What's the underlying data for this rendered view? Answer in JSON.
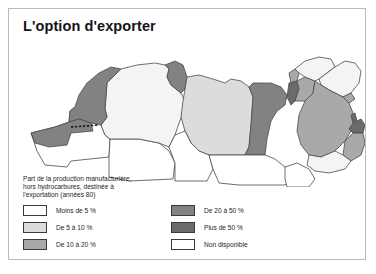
{
  "figure": {
    "title": "L'option d'exporter"
  },
  "legend": {
    "caption": "Part de la production manufacturière,\nhors hydrocarbures, destinée à\nl'exportation (années 80)",
    "columns": [
      {
        "items": [
          {
            "label": "Moins de 5 %",
            "color": "#ffffff"
          },
          {
            "label": "De 5 à 10 %",
            "color": "#dcdcdc"
          },
          {
            "label": "De 10 à 20 %",
            "color": "#a9a9a9"
          }
        ]
      },
      {
        "items": [
          {
            "label": "De 20 à 50 %",
            "color": "#828282"
          },
          {
            "label": "Plus de 50 %",
            "color": "#6b6b6b"
          },
          {
            "label": "Non disponible",
            "color": "#ffffff"
          }
        ]
      }
    ]
  },
  "map": {
    "description": "Carte de l'Afrique du Nord et du Moyen-Orient",
    "stroke": "#4a4a4a",
    "regions": [
      {
        "name": "maroc",
        "class": "De 20 à 50 %",
        "color": "#828282"
      },
      {
        "name": "sahara-occidental",
        "class": "De 20 à 50 %",
        "color": "#828282"
      },
      {
        "name": "mauritanie",
        "class": "Non disponible",
        "color": "#ffffff"
      },
      {
        "name": "algerie",
        "class": "Moins de 5 %",
        "color": "#f4f4f4"
      },
      {
        "name": "tunisie",
        "class": "De 20 à 50 %",
        "color": "#828282"
      },
      {
        "name": "libye",
        "class": "De 5 à 10 %",
        "color": "#dcdcdc"
      },
      {
        "name": "egypte",
        "class": "De 20 à 50 %",
        "color": "#828282"
      },
      {
        "name": "mali-niger",
        "class": "Non disponible",
        "color": "#ffffff"
      },
      {
        "name": "tchad",
        "class": "Non disponible",
        "color": "#ffffff"
      },
      {
        "name": "soudan",
        "class": "Non disponible",
        "color": "#ffffff"
      },
      {
        "name": "liban",
        "class": "De 10 à 20 %",
        "color": "#a9a9a9"
      },
      {
        "name": "israel",
        "class": "Plus de 50 %",
        "color": "#6b6b6b"
      },
      {
        "name": "jordanie",
        "class": "De 10 à 20 %",
        "color": "#a9a9a9"
      },
      {
        "name": "syrie",
        "class": "Moins de 5 %",
        "color": "#f4f4f4"
      },
      {
        "name": "irak",
        "class": "Moins de 5 %",
        "color": "#f4f4f4"
      },
      {
        "name": "koweit",
        "class": "De 10 à 20 %",
        "color": "#a9a9a9"
      },
      {
        "name": "arabie-saoudite",
        "class": "De 10 à 20 %",
        "color": "#a9a9a9"
      },
      {
        "name": "qatar",
        "class": "Plus de 50 %",
        "color": "#6b6b6b"
      },
      {
        "name": "emirats",
        "class": "Plus de 50 %",
        "color": "#6b6b6b"
      },
      {
        "name": "oman",
        "class": "De 10 à 20 %",
        "color": "#a9a9a9"
      },
      {
        "name": "yemen",
        "class": "Moins de 5 %",
        "color": "#f4f4f4"
      },
      {
        "name": "corne-afrique",
        "class": "Non disponible",
        "color": "#ffffff"
      }
    ]
  }
}
